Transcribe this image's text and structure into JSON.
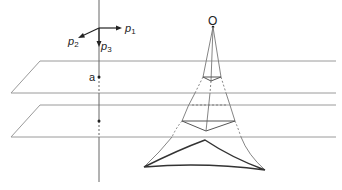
{
  "diagram": {
    "axes": {
      "p1": "p",
      "p1_sub": "1",
      "p2": "p",
      "p2_sub": "2",
      "p3": "p",
      "p3_sub": "3"
    },
    "labels": {
      "apex": "O",
      "point_a": "a"
    },
    "colors": {
      "plane": "#9a9a9a",
      "line": "#666666",
      "bold": "#333333",
      "text": "#222222"
    }
  }
}
